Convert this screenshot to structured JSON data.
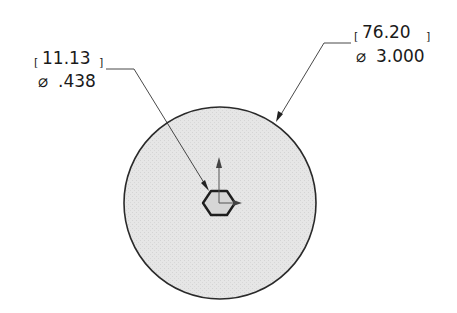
{
  "drawing": {
    "type": "engineering-drawing-top-view",
    "part": "circular disc with hexagonal center hole",
    "colors": {
      "fill": "#e4e4e4",
      "outline": "#2a2a2a",
      "leader": "#333333",
      "text": "#1a1a1a"
    }
  },
  "dimensions": {
    "hex_hole": {
      "metric": "11.13",
      "imperial": ".438",
      "symbol": "⌀",
      "metric_label": "[11.13]",
      "imperial_label": "⌀.438"
    },
    "outer_diameter": {
      "metric": "76.20",
      "imperial": "3.000",
      "symbol": "⌀",
      "metric_label": "[76.20]",
      "imperial_label": "⌀3.000"
    }
  }
}
